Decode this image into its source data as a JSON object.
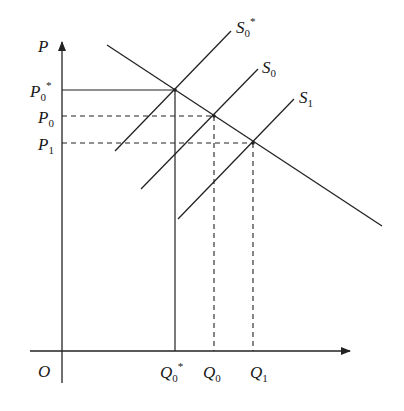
{
  "diagram": {
    "type": "supply-demand",
    "axes": {
      "y_label": "P",
      "origin_label": "O"
    },
    "price_labels": [
      {
        "main": "P",
        "sub": "0",
        "sup": "*"
      },
      {
        "main": "P",
        "sub": "0",
        "sup": ""
      },
      {
        "main": "P",
        "sub": "1",
        "sup": ""
      }
    ],
    "quantity_labels": [
      {
        "main": "Q",
        "sub": "0",
        "sup": "*"
      },
      {
        "main": "Q",
        "sub": "0",
        "sup": ""
      },
      {
        "main": "Q",
        "sub": "1",
        "sup": ""
      }
    ],
    "curves": [
      {
        "main": "S",
        "sub": "0",
        "sup": "*"
      },
      {
        "main": "S",
        "sub": "0",
        "sup": ""
      },
      {
        "main": "S",
        "sub": "1",
        "sup": ""
      }
    ],
    "line_color": "#222222"
  }
}
